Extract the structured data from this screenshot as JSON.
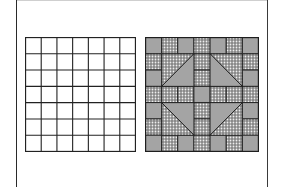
{
  "figure": {
    "panels": [
      {
        "name": "empty-grid",
        "rows": 7,
        "cols": 7,
        "line_color": "#222222",
        "fill": "#ffffff"
      },
      {
        "name": "quilt-block",
        "rows": 7,
        "cols": 7,
        "colors": {
          "gray": "#a4a4a4",
          "dot_bg": "#8a8a8a",
          "dot": "#f0f0f0",
          "line": "#1e1e1e"
        },
        "cells": [
          [
            "G",
            "D",
            "G",
            "D",
            "G",
            "D",
            "G"
          ],
          [
            "D",
            "T",
            "T",
            "D",
            "T",
            "T",
            "D"
          ],
          [
            "G",
            "T",
            "T",
            "D",
            "T",
            "T",
            "G"
          ],
          [
            "D",
            "D",
            "D",
            "G",
            "D",
            "D",
            "D"
          ],
          [
            "G",
            "T",
            "T",
            "D",
            "T",
            "T",
            "G"
          ],
          [
            "D",
            "T",
            "T",
            "D",
            "T",
            "T",
            "D"
          ],
          [
            "G",
            "D",
            "G",
            "D",
            "G",
            "D",
            "G"
          ]
        ],
        "triangles": [
          {
            "name": "top-left",
            "col": 1,
            "row": 1,
            "diagonal": "bl-tr",
            "dotted_half": "upper-left"
          },
          {
            "name": "top-right",
            "col": 4,
            "row": 1,
            "diagonal": "tl-br",
            "dotted_half": "upper-right"
          },
          {
            "name": "bottom-left",
            "col": 1,
            "row": 4,
            "diagonal": "tl-br",
            "dotted_half": "lower-left"
          },
          {
            "name": "bottom-right",
            "col": 4,
            "row": 4,
            "diagonal": "bl-tr",
            "dotted_half": "lower-right"
          }
        ]
      }
    ]
  }
}
